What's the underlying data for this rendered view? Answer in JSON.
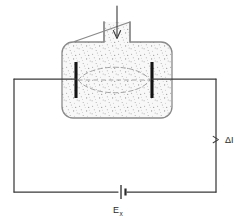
{
  "figure": {
    "background_color": "#ffffff",
    "width": 245,
    "height": 221
  },
  "labels": {
    "current_label": "ΔI",
    "source_label": "E",
    "source_subscript": "x"
  },
  "icons": {
    "inflow_arrow": "down-arrow-icon",
    "battery": "battery-icon",
    "current_marker": "arrow-marker-icon"
  },
  "colors": {
    "wire": "#3a3a3a",
    "vessel_outline": "#8a8a8a",
    "vessel_fill": "#f7f7f7",
    "stipple": "#9a9a9a",
    "electrode": "#141414",
    "field_dashes": "#9e9e9e",
    "text": "#2b2b2b"
  },
  "geometry": {
    "vessel": {
      "body_left": 62,
      "body_right": 172,
      "body_top": 42,
      "body_bottom": 118,
      "corner_radius": 11,
      "neck_left": 104,
      "neck_right": 130,
      "neck_top": 22
    },
    "electrodes": {
      "left_x": 76,
      "right_x": 152,
      "top_y": 62,
      "bottom_y": 98,
      "thickness": 3
    },
    "circuit": {
      "left_x": 14,
      "right_x": 216,
      "top_y": 79,
      "bottom_y": 192,
      "battery_x": 122
    },
    "labels": {
      "current_x": 226,
      "current_y": 140,
      "source_x": 114,
      "source_y": 211
    }
  },
  "description": {
    "inflow": "Downward arrow entering vessel neck",
    "field_region": "Dashed lens-shaped field region between electrodes",
    "circuit_path": "Electrodes wired through external loop containing source"
  }
}
